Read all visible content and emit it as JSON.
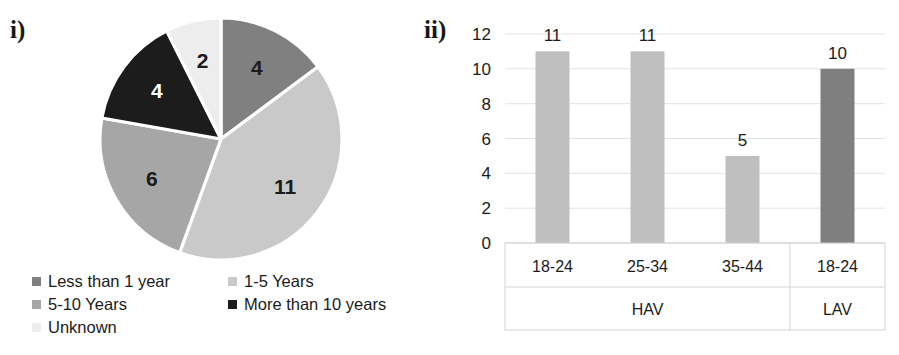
{
  "figure": {
    "panel_i_label": "i)",
    "panel_ii_label": "ii)"
  },
  "colors": {
    "less_than_1_year": "#808080",
    "years_1_5": "#C9C9C9",
    "years_5_10": "#A6A6A6",
    "more_than_10_years": "#1C1C1C",
    "unknown": "#EDEDED",
    "hav_bar": "#BFBFBF",
    "lav_bar": "#7F7F7F",
    "gridline": "#E3E3E3",
    "axis": "#D4D4D4",
    "text": "#1B1B1B"
  },
  "chart_data": [
    {
      "type": "pie",
      "title": "",
      "labels": [
        "Less than 1 year",
        "1-5 Years",
        "5-10 Years",
        "More than 10 years",
        "Unknown"
      ],
      "values": [
        4,
        11,
        6,
        4,
        2
      ],
      "total": 27,
      "data_labels": [
        "4",
        "11",
        "6",
        "4",
        "2"
      ],
      "slice_colors": [
        "#808080",
        "#C9C9C9",
        "#A6A6A6",
        "#1C1C1C",
        "#EDEDED"
      ],
      "data_label_colors": [
        "#1B1B1B",
        "#1B1B1B",
        "#1B1B1B",
        "#FFFFFF",
        "#1B1B1B"
      ],
      "start_angle_deg": 0,
      "direction": "clockwise",
      "legend_position": "bottom",
      "legend": [
        {
          "label": "Less than 1 year",
          "color": "#808080"
        },
        {
          "label": "1-5 Years",
          "color": "#C9C9C9"
        },
        {
          "label": "5-10 Years",
          "color": "#A6A6A6"
        },
        {
          "label": "More than 10 years",
          "color": "#1C1C1C"
        },
        {
          "label": "Unknown",
          "color": "#EDEDED"
        }
      ]
    },
    {
      "type": "bar",
      "title": "",
      "xlabel": "",
      "ylabel": "",
      "ylim": [
        0,
        12
      ],
      "yticks": [
        "0",
        "2",
        "4",
        "6",
        "8",
        "10",
        "12"
      ],
      "ytick_values": [
        0,
        2,
        4,
        6,
        8,
        10,
        12
      ],
      "grid": true,
      "categories": [
        "18-24",
        "25-34",
        "35-44",
        "18-24"
      ],
      "values": [
        11,
        11,
        5,
        10
      ],
      "data_labels": [
        "11",
        "11",
        "5",
        "10"
      ],
      "bar_colors": [
        "#BFBFBF",
        "#BFBFBF",
        "#BFBFBF",
        "#7F7F7F"
      ],
      "groups": [
        {
          "label": "HAV",
          "categories": [
            "18-24",
            "25-34",
            "35-44"
          ]
        },
        {
          "label": "LAV",
          "categories": [
            "18-24"
          ]
        }
      ],
      "legend_position": "none"
    }
  ]
}
